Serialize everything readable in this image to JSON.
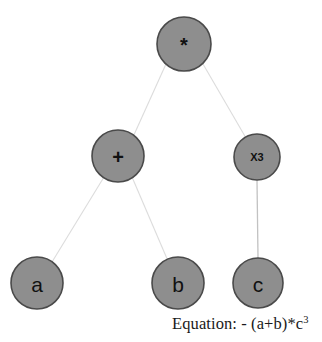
{
  "diagram": {
    "type": "expression-tree",
    "background_color": "#ffffff",
    "node_fill_color": "#8e8e8e",
    "node_border_color": "#4a4a4a",
    "edge_color": "#dcdcdc",
    "nodes": [
      {
        "id": "root",
        "label": "*",
        "role": "operator-multiply",
        "cx": 184,
        "cy": 44,
        "r": 27,
        "label_style": "op"
      },
      {
        "id": "plus",
        "label": "+",
        "role": "operator-add",
        "cx": 118,
        "cy": 156,
        "r": 26,
        "label_style": "op"
      },
      {
        "id": "pow",
        "label": "X3",
        "role": "operator-power",
        "cx": 257,
        "cy": 157,
        "r": 23,
        "label_style": "small"
      },
      {
        "id": "a",
        "label": "a",
        "role": "variable",
        "cx": 37,
        "cy": 283,
        "r": 26,
        "label_style": "big"
      },
      {
        "id": "b",
        "label": "b",
        "role": "variable",
        "cx": 178,
        "cy": 283,
        "r": 26,
        "label_style": "big"
      },
      {
        "id": "c",
        "label": "c",
        "role": "variable",
        "cx": 258,
        "cy": 283,
        "r": 25,
        "label_style": "big"
      }
    ],
    "edges": [
      {
        "from": "root",
        "to": "plus",
        "x1": 166,
        "y1": 64,
        "x2": 133,
        "y2": 137,
        "shade": "light"
      },
      {
        "from": "root",
        "to": "pow",
        "x1": 203,
        "y1": 64,
        "x2": 246,
        "y2": 138,
        "shade": "light"
      },
      {
        "from": "plus",
        "to": "a",
        "x1": 104,
        "y1": 177,
        "x2": 52,
        "y2": 262,
        "shade": "light"
      },
      {
        "from": "plus",
        "to": "b",
        "x1": 132,
        "y1": 177,
        "x2": 168,
        "y2": 261,
        "shade": "light"
      },
      {
        "from": "pow",
        "to": "c",
        "x1": 257,
        "y1": 180,
        "x2": 258,
        "y2": 258,
        "shade": "dark"
      }
    ]
  },
  "caption": {
    "label": "Equation: - (a+b)*c",
    "exponent": "3",
    "full_text": "Equation: - (a+b)*c3"
  }
}
